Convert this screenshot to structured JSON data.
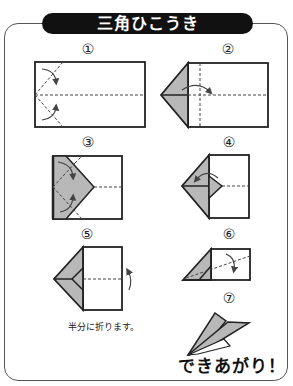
{
  "title": "三角ひこうき",
  "steps": [
    {
      "number": "①"
    },
    {
      "number": "②"
    },
    {
      "number": "③"
    },
    {
      "number": "④"
    },
    {
      "number": "⑤",
      "caption": "半分に折ります。"
    },
    {
      "number": "⑥"
    },
    {
      "number": "⑦"
    }
  ],
  "finish_label": "できあがり！",
  "colors": {
    "fill_gray": "#b8b8b8",
    "line": "#222222",
    "title_bg": "#111111",
    "title_text": "#ffffff"
  }
}
